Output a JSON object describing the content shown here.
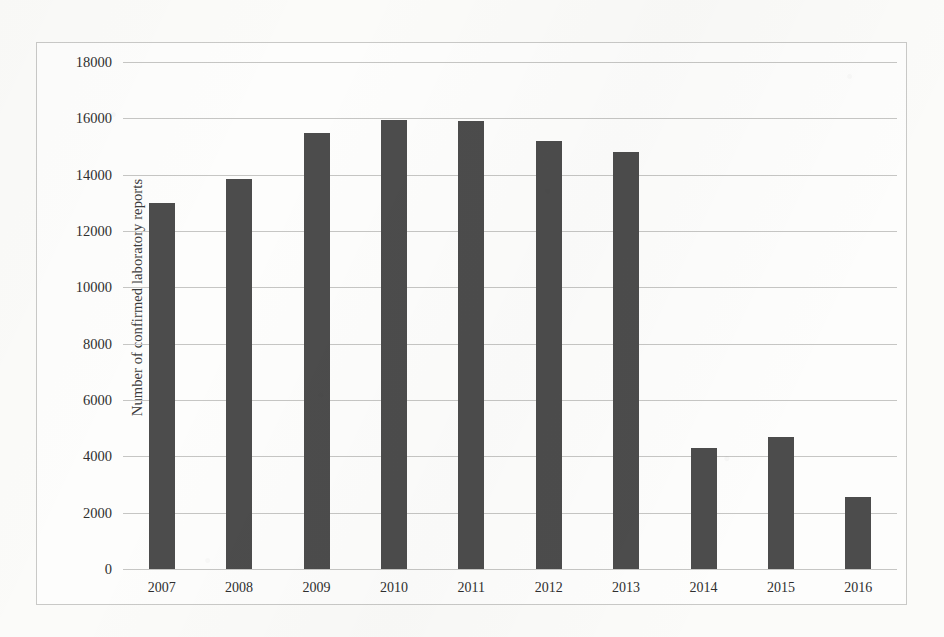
{
  "chart_data": {
    "type": "bar",
    "title": "",
    "subtitle": "",
    "xlabel": "",
    "ylabel": "Number of confirmed laboratory reports",
    "categories": [
      "2007",
      "2008",
      "2009",
      "2010",
      "2011",
      "2012",
      "2013",
      "2014",
      "2015",
      "2016"
    ],
    "values": [
      13000,
      13840,
      15470,
      15950,
      15900,
      15200,
      14800,
      4300,
      4700,
      2550
    ],
    "series": [
      {
        "name": "Confirmed laboratory reports",
        "values": [
          13000,
          13840,
          15470,
          15950,
          15900,
          15200,
          14800,
          4300,
          4700,
          2550
        ]
      }
    ],
    "ylim": [
      0,
      18000
    ],
    "ytick_step": 2000,
    "ytick_labels": [
      "0",
      "2000",
      "4000",
      "6000",
      "8000",
      "10000",
      "12000",
      "14000",
      "16000",
      "18000"
    ],
    "ytick_values": [
      0,
      2000,
      4000,
      6000,
      8000,
      10000,
      12000,
      14000,
      16000,
      18000
    ],
    "grid": true,
    "grid_axis": "y",
    "legend": false,
    "legend_position": "none",
    "bar_color": "#4c4c4c",
    "gridline_color": "#c6c6c4",
    "plot_background": "#fdfdfc",
    "frame_border_color": "#c9c9c7",
    "annotations": []
  }
}
